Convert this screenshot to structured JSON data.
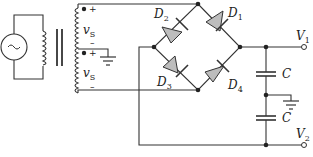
{
  "source": {
    "symbol": "~",
    "type": "ac-voltage-source"
  },
  "transformer": {
    "windings": [
      {
        "label": "v",
        "sub": "S",
        "plus": "+",
        "minus": "–"
      },
      {
        "label": "v",
        "sub": "S",
        "plus": "+",
        "minus": "–"
      }
    ]
  },
  "diodes": [
    {
      "label": "D",
      "sub": "1"
    },
    {
      "label": "D",
      "sub": "2"
    },
    {
      "label": "D",
      "sub": "3"
    },
    {
      "label": "D",
      "sub": "4"
    }
  ],
  "capacitors": [
    {
      "label": "C"
    },
    {
      "label": "C"
    }
  ],
  "outputs": [
    {
      "label": "V",
      "sub": "1"
    },
    {
      "label": "V",
      "sub": "2"
    }
  ],
  "colors": {
    "wire": "#333333",
    "diode_fill": "#bdbdbd"
  }
}
